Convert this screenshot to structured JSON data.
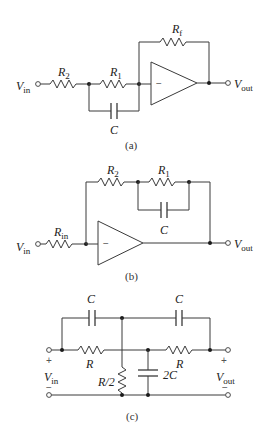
{
  "figure": {
    "a": {
      "caption": "(a)",
      "labels": {
        "vin": "V",
        "vin_sub": "in",
        "vout": "V",
        "vout_sub": "out",
        "r2": "R",
        "r2_sub": "2",
        "r1": "R",
        "r1_sub": "1",
        "rf": "R",
        "rf_sub": "f",
        "c": "C",
        "minus": "−"
      }
    },
    "b": {
      "caption": "(b)",
      "labels": {
        "vin": "V",
        "vin_sub": "in",
        "vout": "V",
        "vout_sub": "out",
        "rin": "R",
        "rin_sub": "in",
        "r2": "R",
        "r2_sub": "2",
        "r1": "R",
        "r1_sub": "1",
        "c": "C",
        "minus": "−"
      }
    },
    "c": {
      "caption": "(c)",
      "labels": {
        "c_left": "C",
        "c_right": "C",
        "r_left": "R",
        "r_right": "R",
        "r_half": "R/2",
        "c2": "2C",
        "vin": "V",
        "vin_sub": "in",
        "vout": "V",
        "vout_sub": "out",
        "plus": "+",
        "minus": "−"
      }
    }
  }
}
